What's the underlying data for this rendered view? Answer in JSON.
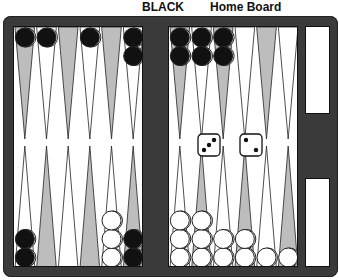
{
  "header": {
    "player_label": "BLACK",
    "board_label": "Home Board"
  },
  "colors": {
    "frame": "#3a3a3a",
    "point_dark": "#bdbdbd",
    "point_light": "#ffffff",
    "checker_black": "#111111",
    "checker_white": "#ffffff"
  },
  "dice": [
    3,
    2
  ],
  "board": {
    "top_left": [
      {
        "color": "black",
        "count": 1
      },
      {
        "color": "black",
        "count": 1
      },
      {
        "color": "none",
        "count": 0
      },
      {
        "color": "black",
        "count": 1
      },
      {
        "color": "none",
        "count": 0
      },
      {
        "color": "black",
        "count": 2
      }
    ],
    "top_right": [
      {
        "color": "black",
        "count": 2
      },
      {
        "color": "black",
        "count": 2
      },
      {
        "color": "black",
        "count": 2
      },
      {
        "color": "none",
        "count": 0
      },
      {
        "color": "none",
        "count": 0
      },
      {
        "color": "none",
        "count": 0
      }
    ],
    "bottom_left": [
      {
        "color": "black",
        "count": 2
      },
      {
        "color": "none",
        "count": 0
      },
      {
        "color": "none",
        "count": 0
      },
      {
        "color": "none",
        "count": 0
      },
      {
        "color": "white",
        "count": 3
      },
      {
        "color": "black",
        "count": 2
      }
    ],
    "bottom_right": [
      {
        "color": "white",
        "count": 3
      },
      {
        "color": "white",
        "count": 3
      },
      {
        "color": "white",
        "count": 2
      },
      {
        "color": "white",
        "count": 2
      },
      {
        "color": "white",
        "count": 1
      },
      {
        "color": "white",
        "count": 1
      }
    ]
  }
}
